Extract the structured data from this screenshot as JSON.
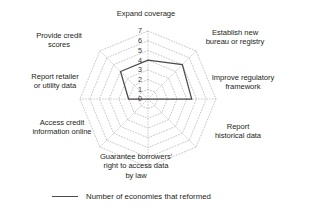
{
  "chart_data": {
    "type": "radar",
    "title": "",
    "categories": [
      "Expand coverage",
      "Establish new bureau or registry",
      "Improve regulatory framework",
      "Report historical data",
      "Guarantee borrowers' right to access data by law",
      "Access credit information online",
      "Report retailer or utility data",
      "Provide credit scores"
    ],
    "series": [
      {
        "name": "Number of economies that reformed",
        "values": [
          4,
          5,
          4.5,
          0,
          0,
          0,
          2,
          4
        ]
      }
    ],
    "tick_labels": [
      "0",
      "1",
      "2",
      "3",
      "4",
      "5",
      "6",
      "7"
    ],
    "rlim": [
      0,
      7
    ],
    "grid": "dotted-polygon",
    "grid_rings": 7,
    "legend_position": "bottom",
    "line_color": "#4c4a4b",
    "grid_color": "#b9b7b8"
  },
  "labels": {
    "expand_coverage": "Expand coverage",
    "establish_bureau": "Establish new\nbureau or registry",
    "improve_regulatory": "Improve regulatory\nframework",
    "report_historical": "Report\nhistorical data",
    "guarantee_borrowers": "Guarantee borrowers'\nright to access data\nby law",
    "access_online": "Access credit\ninformation online",
    "report_retailer": "Report retailer\nor utility data",
    "provide_scores": "Provide credit\nscores"
  },
  "ticks": {
    "t0": "0",
    "t1": "1",
    "t2": "2",
    "t3": "3",
    "t4": "4",
    "t5": "5",
    "t6": "6",
    "t7": "7"
  },
  "legend": {
    "series_label": "Number of economies that reformed"
  }
}
